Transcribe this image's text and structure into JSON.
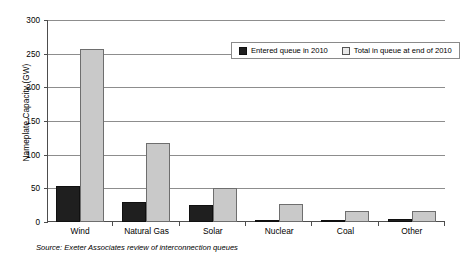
{
  "chart_data": {
    "type": "bar",
    "title": "",
    "xlabel": "",
    "ylabel": "Nameplate Capacity (GW)",
    "ylim": [
      0,
      300
    ],
    "yticks": [
      0,
      50,
      100,
      150,
      200,
      250,
      300
    ],
    "grid": true,
    "legend_position": "top-right-inside",
    "categories": [
      "Wind",
      "Natural Gas",
      "Solar",
      "Nuclear",
      "Coal",
      "Other"
    ],
    "series": [
      {
        "name": "Entered queue in 2010",
        "color": "#1f1f1f",
        "values": [
          53,
          30,
          25,
          3,
          0.5,
          4
        ]
      },
      {
        "name": "Total in queue at end of 2010",
        "color": "#c9c9c9",
        "values": [
          257,
          117,
          51,
          27,
          16,
          16
        ]
      }
    ],
    "annotations": {
      "source": "Source: Exeter Associates review of interconnection queues"
    }
  }
}
